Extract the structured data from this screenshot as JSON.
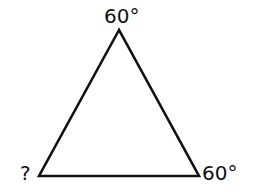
{
  "diagram": {
    "type": "triangle",
    "vertices": {
      "top": {
        "x": 119,
        "y": 30,
        "label": "60°"
      },
      "bottom_left": {
        "x": 39,
        "y": 176,
        "label": "?"
      },
      "bottom_right": {
        "x": 199,
        "y": 176,
        "label": "60°"
      }
    },
    "stroke_color": "#111111",
    "background": "#ffffff"
  }
}
